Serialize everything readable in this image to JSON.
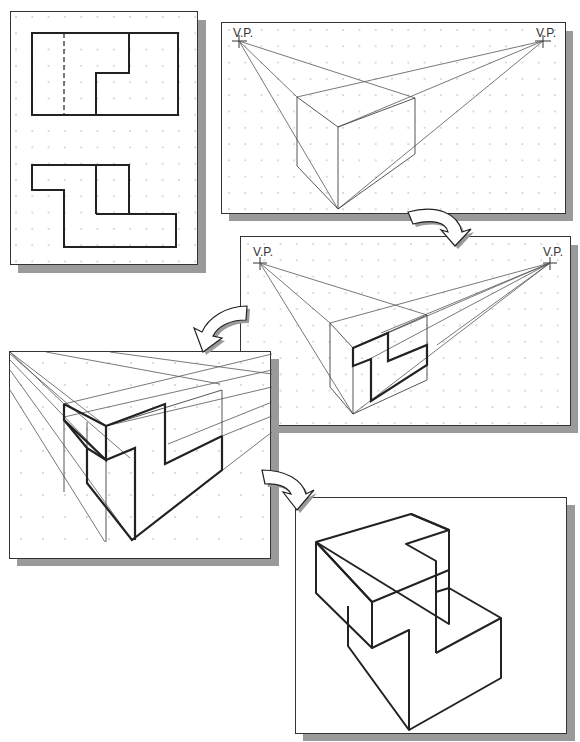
{
  "diagram": {
    "colors": {
      "line": "#222222",
      "thin_line": "#555555",
      "dot": "#9a9a9a",
      "shadow": "#9a9a9a",
      "panel_bg": "#ffffff",
      "arrow_fill": "#ffffff"
    },
    "panels": [
      {
        "id": "orthographic-views",
        "step": 1,
        "description": "Top and front orthographic views on dot grid"
      },
      {
        "id": "bounding-box-perspective",
        "step": 2,
        "description": "Two vanishing points with perspective bounding box",
        "vp_left_label": "V.P.",
        "vp_right_label": "V.P."
      },
      {
        "id": "front-face-profile",
        "step": 3,
        "description": "Z-shaped profile drawn on front face of box",
        "vp_left_label": "V.P.",
        "vp_right_label": "V.P."
      },
      {
        "id": "enlarged-construction",
        "step": 4,
        "description": "Enlarged view with projection lines to vanishing points"
      },
      {
        "id": "final-object",
        "step": 5,
        "description": "Completed perspective drawing of the object"
      }
    ],
    "arrows": [
      {
        "id": "arrow-1-to-2",
        "from": 2,
        "to": 3
      },
      {
        "id": "arrow-3-to-4",
        "from": 3,
        "to": 4
      },
      {
        "id": "arrow-4-to-5",
        "from": 4,
        "to": 5
      }
    ]
  }
}
